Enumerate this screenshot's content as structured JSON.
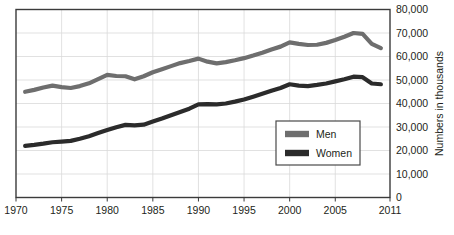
{
  "chart_data": {
    "type": "line",
    "title": "",
    "subtitle": "",
    "xlabel": "",
    "ylabel": "Numbers in thousands",
    "xlim": [
      1970,
      2011
    ],
    "ylim": [
      0,
      80000
    ],
    "grid": true,
    "legend_position": "inside-right-lower",
    "x_tick_labels": [
      "1970",
      "1975",
      "1980",
      "1985",
      "1990",
      "1995",
      "2000",
      "2005",
      "2011"
    ],
    "x_tick_values": [
      1970,
      1975,
      1980,
      1985,
      1990,
      1995,
      2000,
      2005,
      2011
    ],
    "y_tick_labels": [
      "0",
      "10,000",
      "20,000",
      "30,000",
      "40,000",
      "50,000",
      "60,000",
      "70,000",
      "80,000"
    ],
    "y_tick_values": [
      0,
      10000,
      20000,
      30000,
      40000,
      50000,
      60000,
      70000,
      80000
    ],
    "x": [
      1971,
      1972,
      1973,
      1974,
      1975,
      1976,
      1977,
      1978,
      1979,
      1980,
      1981,
      1982,
      1983,
      1984,
      1985,
      1986,
      1987,
      1988,
      1989,
      1990,
      1991,
      1992,
      1993,
      1994,
      1995,
      1996,
      1997,
      1998,
      1999,
      2000,
      2001,
      2002,
      2003,
      2004,
      2005,
      2006,
      2007,
      2008,
      2009,
      2010
    ],
    "series": [
      {
        "name": "Men",
        "color": "#6e6e6e",
        "values": [
          45000,
          45800,
          46800,
          47600,
          47000,
          46600,
          47400,
          48600,
          50400,
          52200,
          51700,
          51600,
          50300,
          51600,
          53300,
          54600,
          55900,
          57200,
          58100,
          59100,
          57800,
          57100,
          57600,
          58400,
          59300,
          60400,
          61600,
          63000,
          64200,
          66000,
          65400,
          64900,
          65000,
          65800,
          67000,
          68400,
          70000,
          69600,
          65400,
          63600
        ]
      },
      {
        "name": "Women",
        "color": "#2b2b2b",
        "values": [
          22000,
          22400,
          22900,
          23500,
          23800,
          24100,
          25000,
          26100,
          27400,
          28700,
          29900,
          30900,
          30700,
          31000,
          32300,
          33600,
          35000,
          36400,
          37800,
          39600,
          39700,
          39600,
          40000,
          40800,
          41700,
          42900,
          44100,
          45400,
          46600,
          48200,
          47600,
          47400,
          47900,
          48500,
          49400,
          50300,
          51400,
          51200,
          48500,
          48200
        ]
      }
    ]
  },
  "legend": {
    "items": [
      {
        "label": "Men",
        "color": "#6e6e6e"
      },
      {
        "label": "Women",
        "color": "#2b2b2b"
      }
    ]
  }
}
